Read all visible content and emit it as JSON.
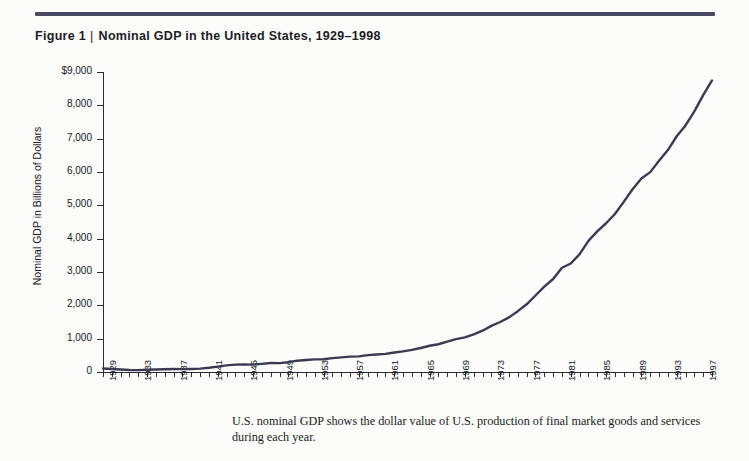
{
  "figure": {
    "label": "Figure 1",
    "separator": "|",
    "title": "Nominal GDP in the United States, 1929–1998",
    "rule_color": "#4a4a63"
  },
  "caption": {
    "text": "U.S. nominal GDP shows the dollar value of U.S. production of final market goods and services during each year."
  },
  "chart_data": {
    "type": "line",
    "title": "Nominal GDP in the United States, 1929–1998",
    "xlabel": "",
    "ylabel": "Nominal GDP in Billions of Dollars",
    "xlim": [
      1929,
      1998
    ],
    "ylim": [
      0,
      9000
    ],
    "grid": false,
    "legend": null,
    "line_color": "#3a3a52",
    "line_width": 2.4,
    "y_ticks": [
      0,
      1000,
      2000,
      3000,
      4000,
      5000,
      6000,
      7000,
      8000,
      9000
    ],
    "y_tick_labels": [
      "0",
      "1,000",
      "2,000",
      "3,000",
      "4,000",
      "5,000",
      "6,000",
      "7,000",
      "8,000",
      "$9,000"
    ],
    "x_tick_labels": [
      "1929",
      "1933",
      "1937",
      "1941",
      "1945",
      "1949",
      "1953",
      "1957",
      "1961",
      "1965",
      "1969",
      "1973",
      "1977",
      "1981",
      "1985",
      "1989",
      "1993",
      "1997"
    ],
    "x_tick_label_step": 4,
    "x_minor_ticks_every": 1,
    "series": [
      {
        "name": "Nominal GDP",
        "x": [
          1929,
          1930,
          1931,
          1932,
          1933,
          1934,
          1935,
          1936,
          1937,
          1938,
          1939,
          1940,
          1941,
          1942,
          1943,
          1944,
          1945,
          1946,
          1947,
          1948,
          1949,
          1950,
          1951,
          1952,
          1953,
          1954,
          1955,
          1956,
          1957,
          1958,
          1959,
          1960,
          1961,
          1962,
          1963,
          1964,
          1965,
          1966,
          1967,
          1968,
          1969,
          1970,
          1971,
          1972,
          1973,
          1974,
          1975,
          1976,
          1977,
          1978,
          1979,
          1980,
          1981,
          1982,
          1983,
          1984,
          1985,
          1986,
          1987,
          1988,
          1989,
          1990,
          1991,
          1992,
          1993,
          1994,
          1995,
          1996,
          1997,
          1998
        ],
        "values": [
          103.6,
          91.2,
          76.5,
          58.7,
          56.4,
          66.0,
          73.3,
          83.8,
          91.9,
          86.1,
          92.2,
          101.4,
          126.7,
          161.9,
          198.6,
          219.8,
          223.1,
          222.3,
          244.4,
          269.6,
          267.7,
          294.3,
          339.5,
          358.6,
          379.9,
          381.1,
          415.2,
          438.0,
          461.5,
          467.9,
          506.6,
          526.4,
          544.8,
          585.2,
          617.4,
          663.0,
          719.1,
          787.7,
          832.6,
          910.0,
          984.6,
          1038.5,
          1127.1,
          1238.3,
          1382.7,
          1500.0,
          1638.3,
          1825.3,
          2030.9,
          2294.7,
          2563.3,
          2789.5,
          3128.4,
          3255.0,
          3536.7,
          3933.2,
          4220.3,
          4462.8,
          4739.5,
          5103.8,
          5484.4,
          5803.1,
          5995.9,
          6337.7,
          6657.4,
          7072.2,
          7397.7,
          7816.9,
          8304.3,
          8747.0
        ]
      }
    ]
  },
  "icons": {}
}
